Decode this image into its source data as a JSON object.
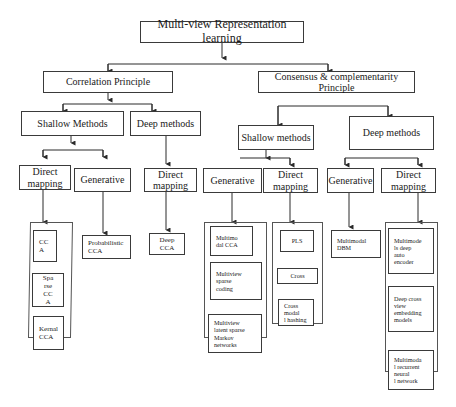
{
  "diagram": {
    "root": "Multi-view Representation learning",
    "level1": {
      "correlation": "Correlation Principle",
      "consensus": "Consensus & complementarity Principle"
    },
    "correlation": {
      "shallow": {
        "label": "Shallow Methods",
        "direct_mapping": {
          "label": "Direct\nmapping",
          "items": [
            "CC\nA",
            "Spa\nrse\nCC\nA",
            "Kernal\nCCA"
          ]
        },
        "generative": {
          "label": "Generative",
          "items": [
            "Probabilistic\nCCA"
          ]
        }
      },
      "deep": {
        "label": "Deep methods",
        "direct_mapping": {
          "label": "Direct\nmapping",
          "items": [
            "Deep\nCCA"
          ]
        }
      }
    },
    "consensus": {
      "shallow": {
        "label": "Shallow methods",
        "generative": {
          "label": "Generative",
          "items": [
            "Multimo\ndal CCA",
            "Multiview\nsparse\ncoding",
            "Multiview\nlatent    sparse\nMarkov\nnetworks"
          ]
        },
        "direct_mapping": {
          "label": "Direct\nmapping",
          "items": [
            "PLS",
            "Cross",
            "Cross\nmodal\nl hashing"
          ]
        }
      },
      "deep": {
        "label": "Deep methods",
        "generative": {
          "label": "Generative",
          "items": [
            "Multimodal\nDBM"
          ]
        },
        "direct_mapping": {
          "label": "Direct\nmapping",
          "items": [
            "Multimode\nls       deep\nauto\nencoder",
            "Deep cross\nview\nembedding\nmodels",
            "Multimoda\nl  recurrent\nneural\nl network"
          ]
        }
      }
    }
  },
  "colors": {
    "line": "#2a2a2a",
    "box_border": "#3a3a3a",
    "background": "#ffffff",
    "text": "#1a1a1a"
  }
}
